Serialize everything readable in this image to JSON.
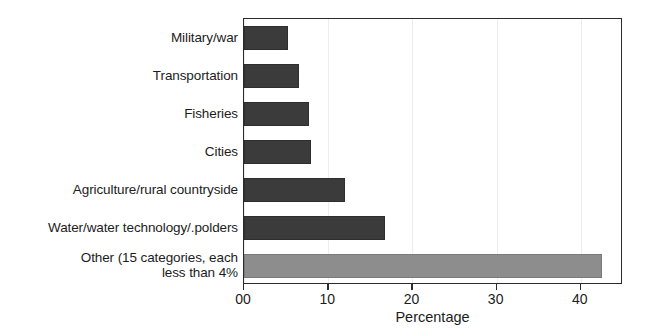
{
  "chart_data": {
    "type": "bar",
    "orientation": "horizontal",
    "title": "",
    "subtitle": "",
    "xlabel": "Percentage",
    "ylabel": "",
    "xlim": [
      0,
      45
    ],
    "xticks": [
      0,
      10,
      20,
      30,
      40
    ],
    "xtick_labels": [
      "00",
      "10",
      "20",
      "30",
      "40"
    ],
    "grid": true,
    "grid_axis": "x",
    "legend": false,
    "legend_position": "none",
    "categories": [
      "Military/war",
      "Transportation",
      "Fisheries",
      "Cities",
      "Agriculture/rural countryside",
      "Water/water technology/.polders",
      "Other (15 categories, each\nless than 4%"
    ],
    "values": [
      5.2,
      6.5,
      7.7,
      8.0,
      12.0,
      16.7,
      42.5
    ],
    "bar_colors": [
      "#3b3b3b",
      "#3b3b3b",
      "#3b3b3b",
      "#3b3b3b",
      "#3b3b3b",
      "#3b3b3b",
      "#8d8d8d"
    ],
    "colors": {
      "bar_dark": "#3b3b3b",
      "bar_light": "#8d8d8d",
      "frame": "#2b2b2b",
      "gridline": "#ededed",
      "text": "#1c1c1c",
      "background": "#ffffff"
    }
  }
}
